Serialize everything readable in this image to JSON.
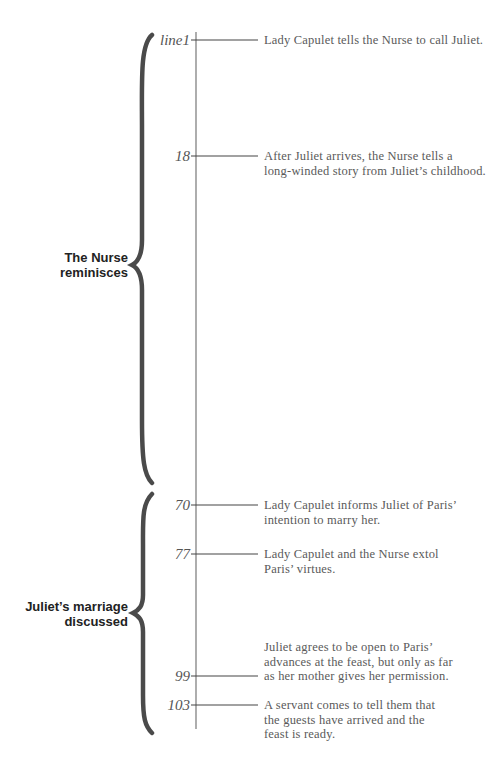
{
  "diagram": {
    "sections": [
      {
        "label_line1": "The Nurse",
        "label_line2": "reminisces"
      },
      {
        "label_line1": "Juliet’s marriage",
        "label_line2": "discussed"
      }
    ],
    "events": [
      {
        "line": "line1",
        "text_lines": [
          "Lady Capulet tells the Nurse to call Juliet."
        ]
      },
      {
        "line": "18",
        "text_lines": [
          "After Juliet arrives, the Nurse tells a",
          "long-winded story from Juliet’s childhood."
        ]
      },
      {
        "line": "70",
        "text_lines": [
          "Lady Capulet informs Juliet of Paris’",
          "intention to marry her."
        ]
      },
      {
        "line": "77",
        "text_lines": [
          "Lady Capulet and the Nurse extol",
          "Paris’ virtues."
        ]
      },
      {
        "line": "99",
        "text_lines": [
          "Juliet agrees to be open to Paris’",
          "advances at the feast, but only as far",
          "as her mother gives her permission."
        ]
      },
      {
        "line": "103",
        "text_lines": [
          "A servant comes to tell them that",
          "the guests have arrived and the",
          "feast is ready."
        ]
      }
    ],
    "colors": {
      "brace": "#4a4a4a",
      "axis": "#777777",
      "tick": "#444444",
      "text": "#5a5a5a",
      "label": "#222222"
    }
  }
}
